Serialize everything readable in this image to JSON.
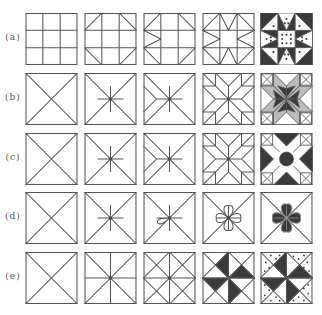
{
  "figure": {
    "rows": [
      {
        "label": "(a)",
        "name": "nine-patch-star",
        "steps": [
          "3x3 grid",
          "corner diagonals",
          "side triangles",
          "full star outline",
          "filled dotted star block"
        ]
      },
      {
        "label": "(b)",
        "name": "eight-point-star",
        "steps": [
          "diagonal cross",
          "center asterisk",
          "left chevrons",
          "full eight-point star",
          "filled star with corner stars"
        ]
      },
      {
        "label": "(c)",
        "name": "eight-point-star-variant",
        "steps": [
          "diagonal cross",
          "center asterisk",
          "left chevrons",
          "full star outline",
          "filled star with corner motifs"
        ]
      },
      {
        "label": "(d)",
        "name": "flower-block",
        "steps": [
          "diagonal cross",
          "center asterisk",
          "single petal",
          "four-petal flower",
          "filled flower"
        ]
      },
      {
        "label": "(e)",
        "name": "pinwheel",
        "steps": [
          "diagonal cross",
          "cross plus diagonals",
          "sub-square diagonals",
          "shaded pinwheel",
          "dotted pinwheel"
        ]
      }
    ]
  },
  "colors": {
    "line": "#555555",
    "fill": "#3a3a3a",
    "background": "#ffffff"
  }
}
